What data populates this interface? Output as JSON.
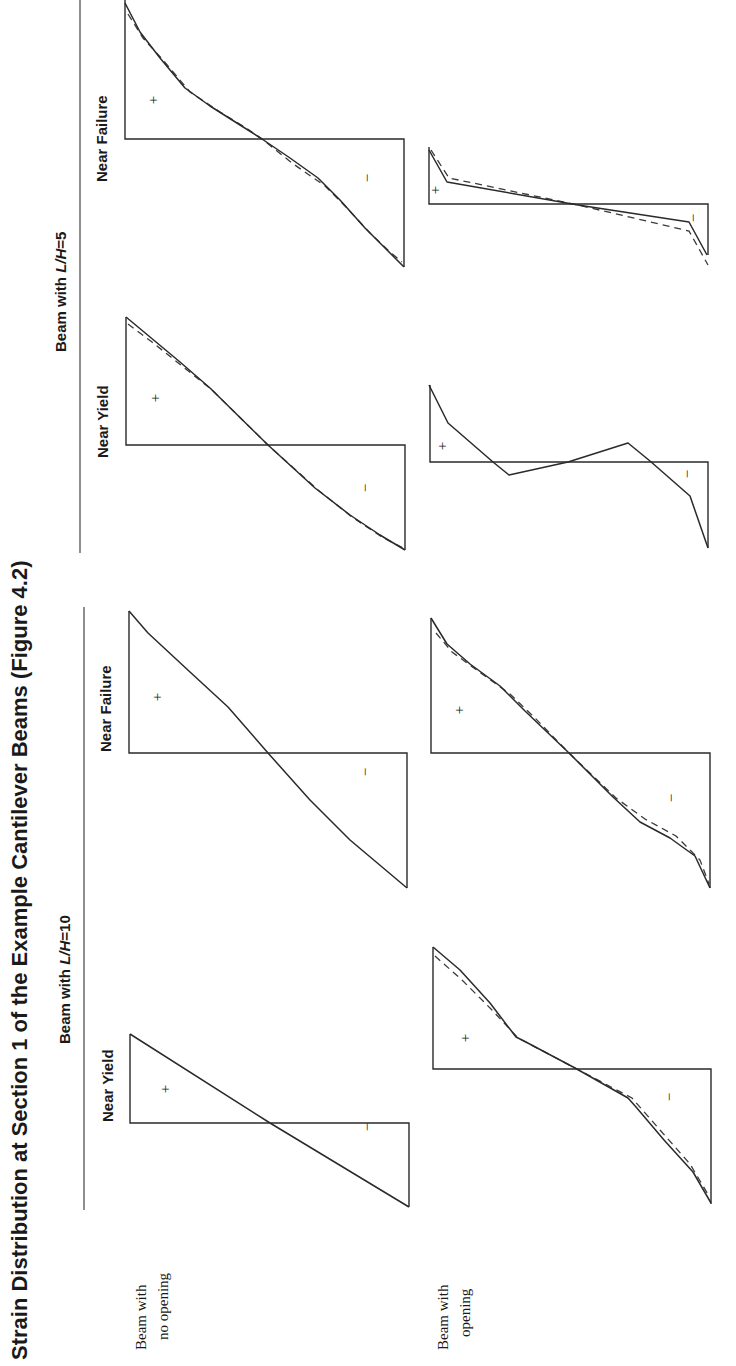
{
  "title": "Strain Distribution at Section 1 of the Example Cantilever Beams (Figure 4.2)",
  "groups": [
    {
      "label": "Beam with L/H=10",
      "label_prefix": "Beam with ",
      "label_var": "L/H",
      "label_val": "=10"
    },
    {
      "label": "Beam with L/H=5",
      "label_prefix": "Beam with ",
      "label_var": "L/H",
      "label_val": "=5"
    }
  ],
  "columns": [
    {
      "label": "Near Yield"
    },
    {
      "label": "Near Failure"
    },
    {
      "label": "Near Yield"
    },
    {
      "label": "Near Failure"
    }
  ],
  "rows": [
    {
      "label_line1": "Beam with",
      "label_line2": "no opening"
    },
    {
      "label_line1": "Beam with",
      "label_line2": "opening"
    }
  ],
  "signs": {
    "positive": "+",
    "negative": "−"
  },
  "legend_note": "Solid line and dashed line represent two strain profiles (curves overlap in most panels)",
  "panels": [
    {
      "id": "no-opening-LH10-near-yield",
      "row": 0,
      "group": 0,
      "column": 0,
      "frame": {
        "x0": 130,
        "x1": 409,
        "ytop": 1034,
        "base": 1123,
        "ybot": 1207
      },
      "plus": [
        170,
        1089
      ],
      "minus": [
        372,
        1127
      ],
      "solid": [
        [
          130,
          1034
        ],
        [
          270,
          1123
        ],
        [
          409,
          1207
        ]
      ],
      "dashed": []
    },
    {
      "id": "no-opening-LH10-near-failure",
      "row": 0,
      "group": 0,
      "column": 1,
      "frame": {
        "x0": 129,
        "x1": 407,
        "ytop": 611,
        "base": 753,
        "ybot": 888
      },
      "plus": [
        162,
        697
      ],
      "minus": [
        370,
        772
      ],
      "solid": [
        [
          129,
          611
        ],
        [
          148,
          633
        ],
        [
          190,
          672
        ],
        [
          228,
          707
        ],
        [
          268,
          753
        ],
        [
          310,
          800
        ],
        [
          350,
          840
        ],
        [
          407,
          888
        ]
      ],
      "dashed": []
    },
    {
      "id": "opening-LH10-near-yield",
      "row": 1,
      "group": 0,
      "column": 0,
      "frame": {
        "x0": 433,
        "x1": 711,
        "ytop": 947,
        "base": 1069,
        "ybot": 1204
      },
      "plus": [
        470,
        1038
      ],
      "minus": [
        674,
        1097
      ],
      "solid": [
        [
          433,
          947
        ],
        [
          460,
          970
        ],
        [
          490,
          1003
        ],
        [
          516,
          1037
        ],
        [
          524,
          1041
        ],
        [
          575,
          1068
        ],
        [
          628,
          1098
        ],
        [
          636,
          1107
        ],
        [
          664,
          1140
        ],
        [
          693,
          1172
        ],
        [
          711,
          1203
        ]
      ],
      "dashed": [
        [
          435,
          956
        ],
        [
          462,
          980
        ],
        [
          492,
          1010
        ],
        [
          518,
          1038
        ],
        [
          575,
          1068
        ],
        [
          632,
          1098
        ],
        [
          660,
          1130
        ],
        [
          690,
          1164
        ],
        [
          709,
          1196
        ]
      ]
    },
    {
      "id": "opening-LH10-near-failure",
      "row": 1,
      "group": 0,
      "column": 1,
      "frame": {
        "x0": 431,
        "x1": 710,
        "ytop": 618,
        "base": 753,
        "ybot": 888
      },
      "plus": [
        464,
        710
      ],
      "minus": [
        676,
        798
      ],
      "solid": [
        [
          431,
          618
        ],
        [
          447,
          644
        ],
        [
          470,
          664
        ],
        [
          500,
          686
        ],
        [
          525,
          711
        ],
        [
          569,
          753
        ],
        [
          613,
          797
        ],
        [
          640,
          822
        ],
        [
          670,
          838
        ],
        [
          695,
          856
        ],
        [
          710,
          888
        ]
      ],
      "dashed": [
        [
          436,
          633
        ],
        [
          452,
          652
        ],
        [
          478,
          671
        ],
        [
          510,
          694
        ],
        [
          535,
          718
        ],
        [
          569,
          753
        ],
        [
          616,
          798
        ],
        [
          645,
          819
        ],
        [
          676,
          836
        ],
        [
          700,
          860
        ],
        [
          709,
          884
        ]
      ]
    },
    {
      "id": "no-opening-LH5-near-yield",
      "row": 0,
      "group": 1,
      "column": 2,
      "frame": {
        "x0": 126,
        "x1": 405,
        "ytop": 317,
        "base": 445,
        "ybot": 550
      },
      "plus": [
        160,
        398
      ],
      "minus": [
        370,
        488
      ],
      "solid": [
        [
          126,
          317
        ],
        [
          150,
          337
        ],
        [
          180,
          362
        ],
        [
          210,
          388
        ],
        [
          268,
          445
        ],
        [
          315,
          488
        ],
        [
          350,
          515
        ],
        [
          380,
          535
        ],
        [
          405,
          550
        ]
      ],
      "dashed": [
        [
          128,
          324
        ],
        [
          152,
          342
        ],
        [
          182,
          366
        ],
        [
          212,
          390
        ],
        [
          268,
          445
        ],
        [
          318,
          490
        ],
        [
          352,
          517
        ],
        [
          382,
          537
        ],
        [
          403,
          548
        ]
      ]
    },
    {
      "id": "no-opening-LH5-near-failure",
      "row": 0,
      "group": 1,
      "column": 3,
      "frame": {
        "x0": 125,
        "x1": 404,
        "ytop": 0,
        "base": 139,
        "ybot": 267
      },
      "plus": [
        158,
        100
      ],
      "minus": [
        372,
        178
      ],
      "solid": [
        [
          125,
          3
        ],
        [
          140,
          32
        ],
        [
          160,
          58
        ],
        [
          185,
          88
        ],
        [
          210,
          106
        ],
        [
          240,
          125
        ],
        [
          262,
          139
        ],
        [
          290,
          158
        ],
        [
          318,
          178
        ],
        [
          340,
          200
        ],
        [
          365,
          228
        ],
        [
          385,
          248
        ],
        [
          404,
          267
        ]
      ],
      "dashed": [
        [
          128,
          14
        ],
        [
          143,
          38
        ],
        [
          163,
          60
        ],
        [
          190,
          92
        ],
        [
          220,
          112
        ],
        [
          246,
          128
        ],
        [
          262,
          139
        ],
        [
          292,
          163
        ],
        [
          325,
          186
        ],
        [
          345,
          206
        ],
        [
          370,
          233
        ],
        [
          390,
          252
        ],
        [
          402,
          262
        ]
      ]
    },
    {
      "id": "opening-LH5-near-yield",
      "row": 1,
      "group": 1,
      "column": 2,
      "frame": {
        "x0": 430,
        "x1": 708,
        "ytop": 385,
        "base": 462,
        "ybot": 548
      },
      "plus": [
        447,
        446
      ],
      "minus": [
        692,
        474
      ],
      "solid": [
        [
          429,
          385
        ],
        [
          448,
          423
        ],
        [
          493,
          462
        ],
        [
          509,
          475
        ],
        [
          568,
          462
        ],
        [
          628,
          443
        ],
        [
          650,
          461
        ],
        [
          690,
          496
        ],
        [
          708,
          548
        ]
      ],
      "dashed": []
    },
    {
      "id": "opening-LH5-near-failure",
      "row": 1,
      "group": 1,
      "column": 3,
      "frame": {
        "x0": 429,
        "x1": 708,
        "ytop": 147,
        "base": 204,
        "ybot": 255
      },
      "plus": [
        440,
        190
      ],
      "minus": [
        698,
        218
      ],
      "solid": [
        [
          429,
          150
        ],
        [
          447,
          182
        ],
        [
          578,
          205
        ],
        [
          689,
          222
        ],
        [
          707,
          255
        ]
      ],
      "dashed": [
        [
          431,
          150
        ],
        [
          449,
          178
        ],
        [
          578,
          205
        ],
        [
          689,
          231
        ],
        [
          708,
          265
        ]
      ]
    }
  ]
}
